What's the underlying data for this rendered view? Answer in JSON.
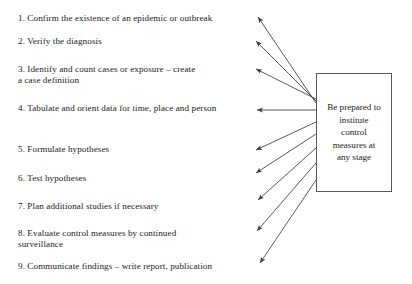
{
  "diagram": {
    "box": {
      "text": "Be prepared to\ninstitute\ncontrol\nmeasures at\nany stage"
    },
    "steps": [
      {
        "number": "1.",
        "text": "1. Confirm the existence of an epidemic or outbreak"
      },
      {
        "number": "2.",
        "text": "2. Verify the diagnosis"
      },
      {
        "number": "3.",
        "text": "3. Identify and count cases or exposure – create\n    a case definition"
      },
      {
        "number": "4.",
        "text": "4. Tabulate and orient data for time, place and person"
      },
      {
        "number": "5.",
        "text": "5. Formulate hypotheses"
      },
      {
        "number": "6.",
        "text": "6. Test hypotheses"
      },
      {
        "number": "7.",
        "text": "7. Plan additional studies if necessary"
      },
      {
        "number": "8.",
        "text": "8. Evaluate control measures by continued\n    surveillance"
      },
      {
        "number": "9.",
        "text": "9. Communicate findings – write report, publication"
      }
    ],
    "colors": {
      "text": "#1a1a1a",
      "box_border": "#5a5a5a",
      "arrow": "#3a3a3a",
      "background": "#ffffff"
    },
    "arrows": [
      {
        "name": "arrow-to-step-1",
        "from_x": 316,
        "from_y": 103,
        "to_x": 258,
        "to_y": 17
      },
      {
        "name": "arrow-to-step-2",
        "from_x": 316,
        "from_y": 101,
        "to_x": 256,
        "to_y": 41
      },
      {
        "name": "arrow-to-step-3",
        "from_x": 316,
        "from_y": 99,
        "to_x": 256,
        "to_y": 69
      },
      {
        "name": "arrow-to-step-4",
        "from_x": 316,
        "from_y": 110,
        "to_x": 257,
        "to_y": 110
      },
      {
        "name": "arrow-to-step-5",
        "from_x": 316,
        "from_y": 122,
        "to_x": 256,
        "to_y": 150
      },
      {
        "name": "arrow-to-step-6",
        "from_x": 316,
        "from_y": 134,
        "to_x": 256,
        "to_y": 173
      },
      {
        "name": "arrow-to-step-7",
        "from_x": 316,
        "from_y": 148,
        "to_x": 258,
        "to_y": 200
      },
      {
        "name": "arrow-to-step-8",
        "from_x": 316,
        "from_y": 163,
        "to_x": 257,
        "to_y": 231
      },
      {
        "name": "arrow-to-step-9",
        "from_x": 316,
        "from_y": 180,
        "to_x": 260,
        "to_y": 263
      }
    ]
  }
}
